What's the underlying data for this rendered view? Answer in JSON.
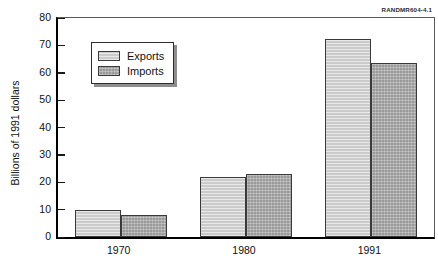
{
  "source_label": "RANDMR604-4.1",
  "legend": {
    "position": "top-left-inside",
    "entries": [
      {
        "label": "Exports",
        "color": "#cbcbcb"
      },
      {
        "label": "Imports",
        "color": "#9a9a9a"
      }
    ]
  },
  "chart_data": {
    "type": "bar",
    "title": "",
    "xlabel": "",
    "ylabel": "Billions of 1991 dollars",
    "categories": [
      "1970",
      "1980",
      "1991"
    ],
    "series": [
      {
        "name": "Exports",
        "color": "#cbcbcb",
        "values": [
          10,
          22,
          72.5
        ]
      },
      {
        "name": "Imports",
        "color": "#9a9a9a",
        "values": [
          8,
          23,
          63.5
        ]
      }
    ],
    "ylim": [
      0,
      80
    ],
    "ytick_values": [
      0,
      10,
      20,
      30,
      40,
      50,
      60,
      70,
      80
    ],
    "ytick_labels": [
      "0",
      "10",
      "20",
      "30",
      "40",
      "50",
      "60",
      "70",
      "80"
    ],
    "grid": false,
    "legend_position": "top-left-inside",
    "annotations": [
      "RANDMR604-4.1"
    ]
  }
}
